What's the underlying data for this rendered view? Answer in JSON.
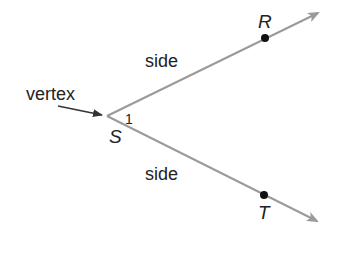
{
  "diagram": {
    "type": "angle",
    "vertex": {
      "label": "S",
      "x": 107,
      "y": 116
    },
    "rays": [
      {
        "name": "ray-SR",
        "point_label": "R",
        "point": [
          265,
          38
        ],
        "tip": [
          318,
          13
        ]
      },
      {
        "name": "ray-ST",
        "point_label": "T",
        "point": [
          264,
          195
        ],
        "tip": [
          317,
          221
        ]
      }
    ],
    "angle_label": "1",
    "side_labels": [
      "side",
      "side"
    ],
    "vertex_callout": "vertex",
    "colors": {
      "ray": "#9a9a9a",
      "text": "#222222",
      "point": "#111111",
      "callout_arrow": "#333333"
    }
  }
}
